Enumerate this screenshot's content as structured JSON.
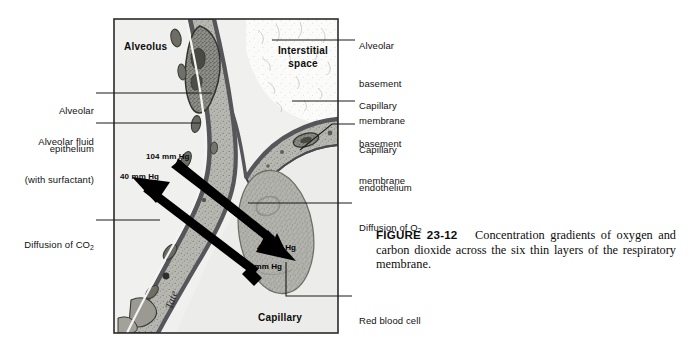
{
  "figure": {
    "number_label": "FIGURE 23-12",
    "caption_text": "Concentration gradients of oxygen and carbon dioxide across the six thin layers of the respiratory membrane.",
    "artist_signature": "Tate"
  },
  "diagram": {
    "interior_labels": {
      "alveolus": "Alveolus",
      "interstitial_space_line1": "Interstitial",
      "interstitial_space_line2": "space",
      "capillary": "Capillary"
    },
    "pressure_labels": [
      {
        "id": "alveolar-o2",
        "value": "104 mm Hg"
      },
      {
        "id": "alveolar-co2",
        "value": "40 mm Hg"
      },
      {
        "id": "blood-o2",
        "value": "40 mm Hg"
      },
      {
        "id": "blood-co2",
        "value": "45 mm Hg"
      }
    ]
  },
  "labels": {
    "left": [
      {
        "id": "alveolar-epithelium",
        "line1": "Alveolar",
        "line2": "epithelium"
      },
      {
        "id": "alveolar-fluid",
        "line1": "Alveolar fluid",
        "line2": "(with surfactant)"
      },
      {
        "id": "diffusion-co2",
        "line1": "Diffusion of CO",
        "sub": "2",
        "line2": ""
      }
    ],
    "right": [
      {
        "id": "alveolar-basement-membrane",
        "line1": "Alveolar",
        "line2": "basement",
        "line3": "membrane"
      },
      {
        "id": "capillary-basement-membrane",
        "line1": "Capillary",
        "line2": "basement",
        "line3": "membrane"
      },
      {
        "id": "capillary-endothelium",
        "line1": "Capillary",
        "line2": "endothelium",
        "line3": ""
      },
      {
        "id": "diffusion-o2",
        "line1": "Diffusion of O",
        "sub": "2",
        "line2": ""
      },
      {
        "id": "red-blood-cell",
        "line1": "Red blood cell",
        "line2": ""
      }
    ]
  },
  "colors": {
    "background": "#ffffff",
    "frame_border": "#2b2b2b",
    "alveolus_fill": "#f0f0ee",
    "interstitial_fill": "#fbfbfa",
    "capillary_lumen": "#ececea",
    "cell_cytoplasm": "#b5b5b0",
    "membrane_dark": "#55555a",
    "nucleus": "#8d8d88",
    "rbc_fill": "#b0b0ab",
    "arrow": "#000000",
    "text": "#111111"
  }
}
